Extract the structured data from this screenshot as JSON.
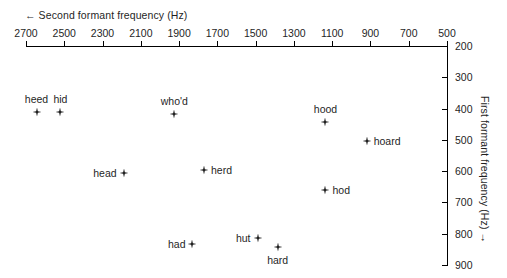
{
  "chart_data": {
    "type": "scatter",
    "title": "",
    "xlabel": "← Second formant frequency (Hz)",
    "ylabel": "First formant frequency (Hz) →",
    "xlim": [
      2700,
      500
    ],
    "ylim": [
      200,
      900
    ],
    "x_ticks": [
      2700,
      2500,
      2300,
      2100,
      1900,
      1700,
      1500,
      1300,
      1100,
      900,
      700,
      500
    ],
    "y_ticks": [
      200,
      300,
      400,
      500,
      600,
      700,
      800,
      900
    ],
    "x_axis_position": "top",
    "y_axis_position": "right",
    "x_axis_reversed": true,
    "y_axis_reversed": true,
    "grid": false,
    "legend": false,
    "marker": "four-pointed-star",
    "marker_color": "#1a1a1a",
    "points": [
      {
        "label": "heed",
        "x": 2645,
        "y": 410,
        "label_pos": "above"
      },
      {
        "label": "hid",
        "x": 2520,
        "y": 410,
        "label_pos": "above"
      },
      {
        "label": "who'd",
        "x": 1925,
        "y": 418,
        "label_pos": "above"
      },
      {
        "label": "hood",
        "x": 1135,
        "y": 444,
        "label_pos": "above"
      },
      {
        "label": "hoard",
        "x": 920,
        "y": 504,
        "label_pos": "right"
      },
      {
        "label": "head",
        "x": 2190,
        "y": 605,
        "label_pos": "left"
      },
      {
        "label": "herd",
        "x": 1770,
        "y": 595,
        "label_pos": "right"
      },
      {
        "label": "hod",
        "x": 1135,
        "y": 660,
        "label_pos": "right"
      },
      {
        "label": "had",
        "x": 1830,
        "y": 833,
        "label_pos": "left"
      },
      {
        "label": "hut",
        "x": 1490,
        "y": 814,
        "label_pos": "left"
      },
      {
        "label": "hard",
        "x": 1385,
        "y": 843,
        "label_pos": "below"
      }
    ]
  },
  "axes": {
    "top_label": "← Second formant frequency (Hz)",
    "right_label": "First formant frequency (Hz) →"
  }
}
